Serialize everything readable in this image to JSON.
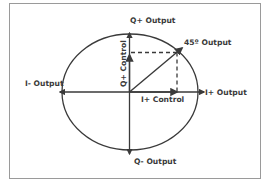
{
  "diagram": {
    "type": "IQ vector diagram",
    "colors": {
      "line": "#3a3a3a",
      "text": "#3b3b3b",
      "frame": "#9a9a9a",
      "background": "#ffffff"
    },
    "axis_labels": {
      "q_positive": "Q+ Output",
      "q_negative": "Q- Output",
      "i_positive": "I+ Output",
      "i_negative": "I- Output"
    },
    "vector_labels": {
      "q_control": "Q+ Control",
      "i_control": "I+ Control",
      "diagonal": "45º Output"
    }
  }
}
